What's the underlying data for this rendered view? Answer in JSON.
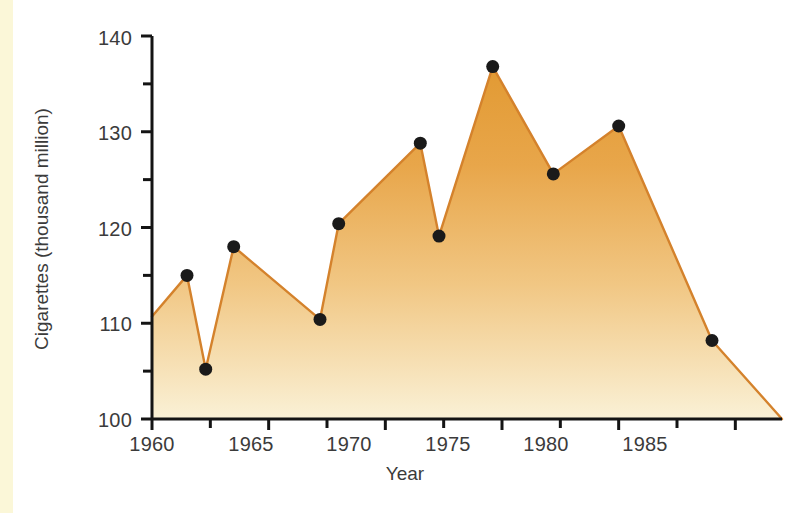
{
  "figure": {
    "background_color": "#ffffff",
    "left_strip_color": "#fbf7d8"
  },
  "chart_data": {
    "type": "area",
    "title": "",
    "xlabel": "Year",
    "ylabel": "Cigarettes (thousand million)",
    "xlim": [
      1960,
      1987
    ],
    "ylim": [
      100,
      140
    ],
    "grid": false,
    "legend": null,
    "x_tick_labels": [
      "1960",
      "1965",
      "1970",
      "1975",
      "1980",
      "1985"
    ],
    "x_major_ticks": [
      1960,
      1965,
      1970,
      1975,
      1980,
      1985
    ],
    "x_minor_tick_interval": 2.5,
    "y_tick_labels": [
      "100",
      "110",
      "120",
      "130",
      "140"
    ],
    "y_major_ticks": [
      100,
      110,
      120,
      130,
      140
    ],
    "y_minor_ticks": [
      105,
      115,
      125,
      135
    ],
    "series": [
      {
        "name": "Cigarettes consumed",
        "fill_top_color": "#e6a13c",
        "fill_bottom_color": "#faf0d4",
        "line_color": "#d4822c",
        "marker_color": "#1a1a1a",
        "x": [
          1960,
          1961.5,
          1962.3,
          1963.5,
          1967.2,
          1968,
          1971.5,
          1972.3,
          1974.6,
          1977.2,
          1980,
          1984,
          1987
        ],
        "values": [
          110.7,
          115.0,
          105.2,
          118.0,
          110.4,
          120.4,
          128.8,
          119.1,
          136.8,
          125.6,
          130.6,
          108.2,
          100.0
        ],
        "markers": [
          false,
          true,
          true,
          true,
          true,
          true,
          true,
          true,
          true,
          true,
          true,
          true,
          false
        ]
      }
    ]
  }
}
